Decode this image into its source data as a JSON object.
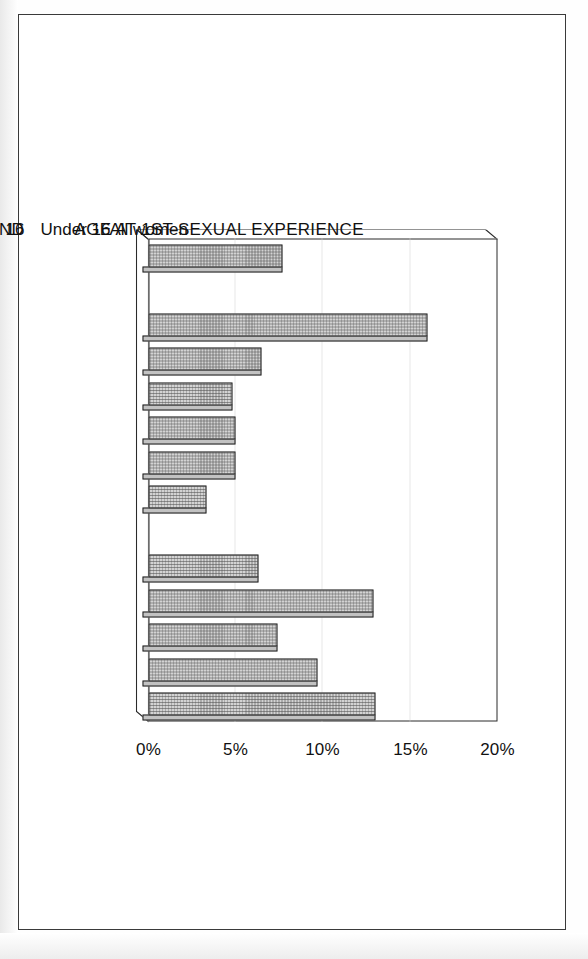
{
  "chart_data": {
    "type": "bar",
    "title": "",
    "subtitle": "",
    "xlabel": "",
    "ylabel": "",
    "orientation": "vertical-bars-on-rotated-page",
    "grid": true,
    "legend": "none",
    "value_axis": {
      "ticks": [
        "0%",
        "5%",
        "10%",
        "15%",
        "20%"
      ],
      "tick_values": [
        0,
        5,
        10,
        15,
        20
      ],
      "min": 0,
      "max": 20,
      "unit": "percent"
    },
    "categories": [
      "All women",
      "AGE AT 1ST SEXUAL EXPERIENCE",
      "Under 16",
      "16",
      "17",
      "18",
      "19",
      "20+",
      "FAMILY BACKGROUND",
      "Both parents from birth",
      "Single parent from birth",
      "Both parents, then 1 parent",
      "Stepparent",
      "Other"
    ],
    "group_headers": [
      "AGE AT 1ST SEXUAL EXPERIENCE",
      "FAMILY BACKGROUND"
    ],
    "values": [
      7.7,
      null,
      16.0,
      6.5,
      4.8,
      5.0,
      5.0,
      3.3,
      null,
      6.3,
      12.9,
      7.4,
      9.7,
      13.0
    ],
    "bars": [
      {
        "label": "All women",
        "value": 7.7,
        "is_header": false
      },
      {
        "label": "AGE AT 1ST SEXUAL EXPERIENCE",
        "value": null,
        "is_header": true
      },
      {
        "label": "Under 16",
        "value": 16.0,
        "is_header": false
      },
      {
        "label": "16",
        "value": 6.5,
        "is_header": false
      },
      {
        "label": "17",
        "value": 4.8,
        "is_header": false
      },
      {
        "label": "18",
        "value": 5.0,
        "is_header": false
      },
      {
        "label": "19",
        "value": 5.0,
        "is_header": false
      },
      {
        "label": "20+",
        "value": 3.3,
        "is_header": false
      },
      {
        "label": "FAMILY BACKGROUND",
        "value": null,
        "is_header": true
      },
      {
        "label": "Both parents from birth",
        "value": 6.3,
        "is_header": false
      },
      {
        "label": "Single parent from birth",
        "value": 12.9,
        "is_header": false
      },
      {
        "label": "Both parents, then 1 parent",
        "value": 7.4,
        "is_header": false
      },
      {
        "label": "Stepparent",
        "value": 9.7,
        "is_header": false
      },
      {
        "label": "Other",
        "value": 13.0,
        "is_header": false
      }
    ],
    "colors": {
      "bar_fill": "#d3d3d3",
      "bar_border": "#1b1b1b",
      "gridline": "#cfcfcf",
      "axis": "#2b2b2b",
      "text": "#111111",
      "page": "#ffffff"
    }
  }
}
